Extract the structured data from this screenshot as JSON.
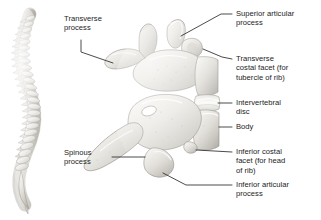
{
  "figure": {
    "background_color": "#ffffff",
    "text_color": "#1c1c1c",
    "leader_color": "#2b2b2b",
    "bone_light": "#f3f2ef",
    "bone_mid": "#d5d3cd",
    "bone_shadow": "#a9a7a1"
  },
  "inset": {
    "name": "vertebral-column-lateral",
    "caption": ""
  },
  "labels": {
    "transverse_process": "Transverse\nprocess",
    "spinous_process": "Spinous\nprocess",
    "superior_articular_process": "Superior articular\nprocess",
    "transverse_costal_facet": "Transverse\ncostal facet (for\ntubercle of rib)",
    "intervertebral_disc": "Intervertebral\ndisc",
    "body": "Body",
    "inferior_costal_facet": "Inferior costal\nfacet (for head\nof rib)",
    "inferior_articular_process": "Inferior articular\nprocess"
  }
}
